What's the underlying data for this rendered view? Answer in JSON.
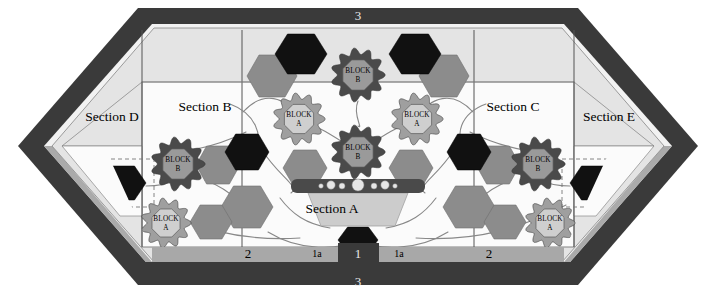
{
  "figure": {
    "type": "schematic-floorplan-diagram",
    "shape": "elongated-hexagon",
    "background_color": "#ffffff"
  },
  "palette": {
    "frame_dark": "#3a3a3a",
    "frame_mid": "#9a9a9a",
    "frame_light": "#d9d9d9",
    "panel_light": "#e4e4e4",
    "panel_white": "#fbfbfb",
    "hex_black": "#111111",
    "hex_gray": "#8c8c8c",
    "block_b_outer": "#4a4a4a",
    "block_b_inner": "#9a9a9a",
    "block_a_outer": "#9f9f9f",
    "block_a_inner": "#cfcfcf",
    "line_gray": "#888888",
    "outline": "#555555"
  },
  "sections": [
    {
      "id": "A",
      "label": "Section A",
      "x": 332,
      "y": 210
    },
    {
      "id": "B",
      "label": "Section B",
      "x": 205,
      "y": 108
    },
    {
      "id": "C",
      "label": "Section C",
      "x": 513,
      "y": 108
    },
    {
      "id": "D",
      "label": "Section D",
      "x": 112,
      "y": 118
    },
    {
      "id": "E",
      "label": "Section E",
      "x": 609,
      "y": 118
    }
  ],
  "edge_labels": {
    "top": [
      {
        "text": "3",
        "x": 358,
        "y": 17
      }
    ],
    "bottom_dark": [
      {
        "text": "3",
        "x": 358,
        "y": 283
      }
    ],
    "bottom_light": [
      {
        "text": "2",
        "x": 248,
        "y": 255,
        "size": "normal"
      },
      {
        "text": "1a",
        "x": 317,
        "y": 255,
        "size": "small"
      },
      {
        "text": "1",
        "x": 358,
        "y": 255,
        "size": "normal"
      },
      {
        "text": "1a",
        "x": 399,
        "y": 255,
        "size": "small"
      },
      {
        "text": "2",
        "x": 489,
        "y": 255,
        "size": "normal"
      }
    ]
  },
  "blocks": [
    {
      "type": "B",
      "label_line1": "BLOCK",
      "label_line2": "B",
      "cx": 358,
      "cy": 75,
      "r": 26
    },
    {
      "type": "B",
      "label_line1": "BLOCK",
      "label_line2": "B",
      "cx": 358,
      "cy": 152,
      "r": 26
    },
    {
      "type": "A",
      "label_line1": "BLOCK",
      "label_line2": "A",
      "cx": 299,
      "cy": 119,
      "r": 25
    },
    {
      "type": "A",
      "label_line1": "BLOCK",
      "label_line2": "A",
      "cx": 417,
      "cy": 119,
      "r": 25
    },
    {
      "type": "B",
      "label_line1": "BLOCK",
      "label_line2": "B",
      "cx": 178,
      "cy": 164,
      "r": 26
    },
    {
      "type": "A",
      "label_line1": "BLOCK",
      "label_line2": "A",
      "cx": 166,
      "cy": 223,
      "r": 24
    },
    {
      "type": "B",
      "label_line1": "BLOCK",
      "label_line2": "B",
      "cx": 538,
      "cy": 164,
      "r": 26
    },
    {
      "type": "A",
      "label_line1": "BLOCK",
      "label_line2": "A",
      "cx": 550,
      "cy": 223,
      "r": 24
    }
  ],
  "black_hexagons": [
    {
      "cx": 301,
      "cy": 54,
      "rx": 26,
      "ry": 20
    },
    {
      "cx": 415,
      "cy": 54,
      "rx": 26,
      "ry": 20
    },
    {
      "cx": 247,
      "cy": 152,
      "rx": 22,
      "ry": 18
    },
    {
      "cx": 469,
      "cy": 152,
      "rx": 22,
      "ry": 18
    },
    {
      "cx": 358,
      "cy": 240,
      "rx": 20,
      "ry": 13
    },
    {
      "cx": 122,
      "cy": 183,
      "rx": 24,
      "ry": 17,
      "dashed_box": true
    },
    {
      "cx": 594,
      "cy": 183,
      "rx": 24,
      "ry": 17,
      "dashed_box": true
    }
  ],
  "gray_hexagons": [
    {
      "cx": 272,
      "cy": 76,
      "rx": 25,
      "ry": 21
    },
    {
      "cx": 444,
      "cy": 76,
      "rx": 25,
      "ry": 21
    },
    {
      "cx": 247,
      "cy": 207,
      "rx": 26,
      "ry": 21
    },
    {
      "cx": 469,
      "cy": 207,
      "rx": 26,
      "ry": 21
    },
    {
      "cx": 218,
      "cy": 165,
      "rx": 22,
      "ry": 19
    },
    {
      "cx": 498,
      "cy": 165,
      "rx": 22,
      "ry": 19
    },
    {
      "cx": 211,
      "cy": 222,
      "rx": 21,
      "ry": 17
    },
    {
      "cx": 505,
      "cy": 222,
      "rx": 21,
      "ry": 17
    },
    {
      "cx": 305,
      "cy": 168,
      "rx": 22,
      "ry": 18
    },
    {
      "cx": 411,
      "cy": 168,
      "rx": 22,
      "ry": 18
    }
  ],
  "center_assembly": {
    "bar": {
      "x": 291,
      "y": 179,
      "width": 134,
      "height": 14,
      "color": "#4a4a4a"
    },
    "dots": [
      {
        "cx": 321,
        "cy": 186,
        "r": 2.3
      },
      {
        "cx": 331,
        "cy": 185,
        "r": 4.2
      },
      {
        "cx": 342,
        "cy": 186,
        "r": 3.0
      },
      {
        "cx": 358,
        "cy": 185,
        "r": 6.0
      },
      {
        "cx": 374,
        "cy": 186,
        "r": 3.0
      },
      {
        "cx": 385,
        "cy": 185,
        "r": 4.2
      },
      {
        "cx": 395,
        "cy": 186,
        "r": 2.3
      }
    ],
    "plinth": {
      "top_width": 100,
      "bottom_width": 74,
      "y": 193,
      "height": 33,
      "color": "#cccccc"
    }
  },
  "notes": {
    "symmetry": "bilateral about vertical centerline x=358"
  }
}
